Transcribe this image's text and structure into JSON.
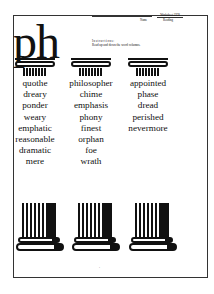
{
  "header": {
    "title": "ph",
    "name_label": "Name",
    "worksheet_number": "Worksheet 1978",
    "subject": "Reading"
  },
  "instructions": {
    "heading": "Instructions:",
    "text": "Read up and down the word columns."
  },
  "columns": [
    {
      "words": [
        "quothe",
        "dreary",
        "ponder",
        "weary",
        "emphatic",
        "reasonable",
        "dramatic",
        "mere"
      ]
    },
    {
      "words": [
        "philosopher",
        "chime",
        "emphasis",
        "phony",
        "finest",
        "orphan",
        "foe",
        "wrath"
      ]
    },
    {
      "words": [
        "appointed",
        "phase",
        "dread",
        "perished",
        "nevermore"
      ]
    }
  ],
  "footer": {
    "page_number": "-"
  },
  "decorations": {
    "capital_icon": "ionic-capital-icon",
    "base_icon": "column-base-icon"
  }
}
